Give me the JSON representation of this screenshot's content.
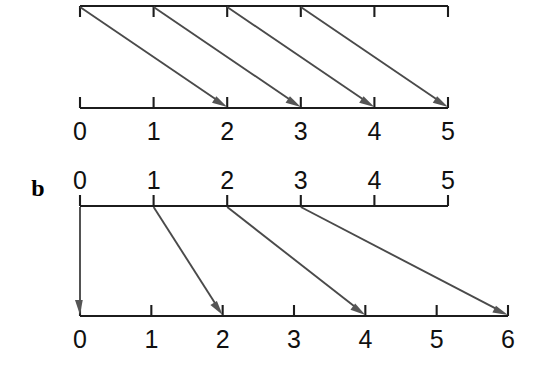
{
  "figure": {
    "background_color": "#ffffff",
    "line_color": "#1c1c1c",
    "arrow_color": "#4a4a4a",
    "panels": [
      {
        "id": "panel-a",
        "label": "",
        "label_visible": false,
        "source_axis": {
          "name": "panel-a-top-axis",
          "ticks": [
            "0",
            "1",
            "2",
            "3",
            "4",
            "5"
          ],
          "labels_visible": false,
          "tick_direction": "down",
          "x_start": 80,
          "x_end": 448,
          "y": 6
        },
        "target_axis": {
          "name": "panel-a-bottom-axis",
          "ticks": [
            "0",
            "1",
            "2",
            "3",
            "4",
            "5"
          ],
          "labels_visible": true,
          "labels": [
            "0",
            "1",
            "2",
            "3",
            "4",
            "5"
          ],
          "tick_direction": "up",
          "x_start": 80,
          "x_end": 448,
          "y": 108
        },
        "mappings": [
          {
            "from": 0,
            "to": 2
          },
          {
            "from": 1,
            "to": 3
          },
          {
            "from": 2,
            "to": 4
          },
          {
            "from": 3,
            "to": 5
          }
        ]
      },
      {
        "id": "panel-b",
        "label": "b",
        "label_visible": true,
        "label_x": 38,
        "label_y": 196,
        "source_axis": {
          "name": "panel-b-top-axis",
          "ticks": [
            "0",
            "1",
            "2",
            "3",
            "4",
            "5"
          ],
          "labels_visible": true,
          "labels": [
            "0",
            "1",
            "2",
            "3",
            "4",
            "5"
          ],
          "labels_position": "above",
          "tick_direction": "up",
          "x_start": 80,
          "x_end": 448,
          "y": 206
        },
        "target_axis": {
          "name": "panel-b-bottom-axis",
          "ticks": [
            "0",
            "1",
            "2",
            "3",
            "4",
            "5",
            "6"
          ],
          "labels_visible": true,
          "labels": [
            "0",
            "1",
            "2",
            "3",
            "4",
            "5",
            "6"
          ],
          "labels_position": "below",
          "tick_direction": "up",
          "x_start": 80,
          "x_end": 508,
          "y": 316
        },
        "mappings": [
          {
            "from": 0,
            "to": 0
          },
          {
            "from": 1,
            "to": 2
          },
          {
            "from": 2,
            "to": 4
          },
          {
            "from": 3,
            "to": 6
          }
        ]
      }
    ]
  },
  "chart_data": {
    "type": "diagram",
    "title": "",
    "panels": [
      {
        "panel": "a",
        "source_ticks": [
          0,
          1,
          2,
          3,
          4,
          5
        ],
        "target_ticks": [
          0,
          1,
          2,
          3,
          4,
          5
        ],
        "arrows": [
          [
            0,
            2
          ],
          [
            1,
            3
          ],
          [
            2,
            4
          ],
          [
            3,
            5
          ]
        ],
        "rule": "n -> n + 2"
      },
      {
        "panel": "b",
        "source_ticks": [
          0,
          1,
          2,
          3,
          4,
          5
        ],
        "target_ticks": [
          0,
          1,
          2,
          3,
          4,
          5,
          6
        ],
        "arrows": [
          [
            0,
            0
          ],
          [
            1,
            2
          ],
          [
            2,
            4
          ],
          [
            3,
            6
          ]
        ],
        "rule": "n -> 2n"
      }
    ]
  }
}
